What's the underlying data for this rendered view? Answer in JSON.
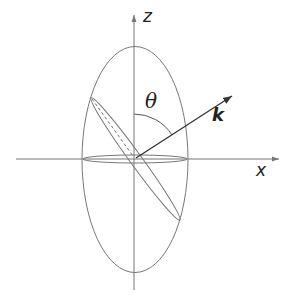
{
  "diagram": {
    "labels": {
      "z_axis": "z",
      "x_axis": "x",
      "angle": "θ",
      "vector": "k"
    },
    "colors": {
      "line": "#777777",
      "arrow": "#333333",
      "text": "#222222",
      "background": "#ffffff"
    },
    "geometry": {
      "origin": [
        135,
        159
      ],
      "outer_ellipse": {
        "rx": 53,
        "ry": 113
      },
      "equatorial_ellipse": {
        "rx": 52,
        "ry": 4
      },
      "tilted_ellipse": {
        "rx": 75,
        "ry": 6,
        "angle_deg": 54
      },
      "k_vector_tip": [
        232,
        96
      ],
      "theta_arc_radius": 45
    }
  }
}
